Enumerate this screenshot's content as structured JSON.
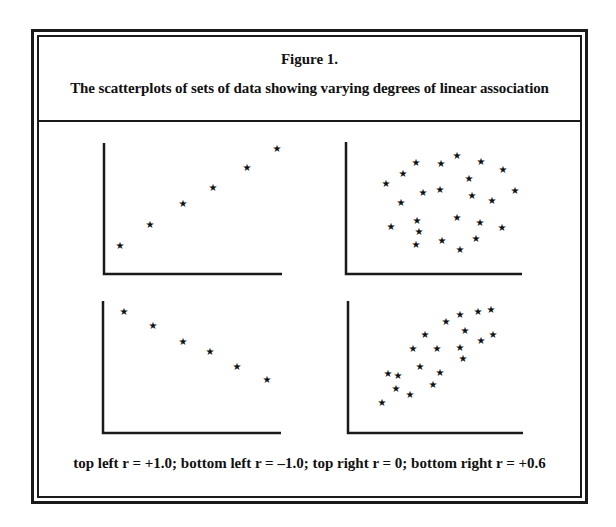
{
  "figure": {
    "label": "Figure 1.",
    "caption": "The scatterplots of sets of data showing varying degrees of linear association",
    "footnote": "top left r = +1.0;  bottom left r = –1.0;  top right r = 0;  bottom right r = +0.6",
    "marker_glyph": "★"
  },
  "chart_data": [
    {
      "type": "scatter",
      "panel": "top-left",
      "r": "+1.0",
      "title": "",
      "xlabel": "",
      "ylabel": "",
      "grid": false,
      "points": [
        [
          120,
          245
        ],
        [
          150,
          224
        ],
        [
          183,
          203
        ],
        [
          213,
          187
        ],
        [
          247,
          167
        ],
        [
          277,
          148
        ]
      ]
    },
    {
      "type": "scatter",
      "panel": "top-right",
      "r": "0",
      "title": "",
      "xlabel": "",
      "ylabel": "",
      "grid": false,
      "points": [
        [
          386,
          183
        ],
        [
          403,
          173
        ],
        [
          416,
          162
        ],
        [
          441,
          163
        ],
        [
          457,
          155
        ],
        [
          481,
          161
        ],
        [
          503,
          169
        ],
        [
          469,
          178
        ],
        [
          423,
          192
        ],
        [
          440,
          189
        ],
        [
          472,
          195
        ],
        [
          492,
          200
        ],
        [
          515,
          190
        ],
        [
          401,
          202
        ],
        [
          417,
          220
        ],
        [
          457,
          217
        ],
        [
          480,
          222
        ],
        [
          502,
          227
        ],
        [
          391,
          226
        ],
        [
          419,
          231
        ],
        [
          476,
          238
        ],
        [
          416,
          244
        ],
        [
          442,
          240
        ],
        [
          460,
          249
        ]
      ]
    },
    {
      "type": "scatter",
      "panel": "bottom-left",
      "r": "-1.0",
      "title": "",
      "xlabel": "",
      "ylabel": "",
      "grid": false,
      "points": [
        [
          124,
          311
        ],
        [
          153,
          325
        ],
        [
          183,
          341
        ],
        [
          210,
          351
        ],
        [
          237,
          366
        ],
        [
          267,
          379
        ]
      ]
    },
    {
      "type": "scatter",
      "panel": "bottom-right",
      "r": "+0.6",
      "title": "",
      "xlabel": "",
      "ylabel": "",
      "grid": false,
      "points": [
        [
          382,
          402
        ],
        [
          388,
          373
        ],
        [
          398,
          375
        ],
        [
          396,
          388
        ],
        [
          410,
          394
        ],
        [
          413,
          348
        ],
        [
          420,
          366
        ],
        [
          425,
          334
        ],
        [
          433,
          384
        ],
        [
          437,
          348
        ],
        [
          440,
          372
        ],
        [
          446,
          321
        ],
        [
          460,
          314
        ],
        [
          465,
          330
        ],
        [
          460,
          347
        ],
        [
          463,
          358
        ],
        [
          478,
          311
        ],
        [
          491,
          309
        ],
        [
          481,
          340
        ],
        [
          493,
          334
        ]
      ]
    }
  ],
  "axes": [
    {
      "panel": "top-left",
      "x0": 104,
      "ytop": 143,
      "ybase": 274,
      "xright": 282
    },
    {
      "panel": "top-right",
      "x0": 346,
      "ytop": 142,
      "ybase": 274,
      "xright": 522
    },
    {
      "panel": "bottom-left",
      "x0": 103,
      "ytop": 301,
      "ybase": 433,
      "xright": 281
    },
    {
      "panel": "bottom-right",
      "x0": 348,
      "ytop": 301,
      "ybase": 433,
      "xright": 523
    }
  ]
}
